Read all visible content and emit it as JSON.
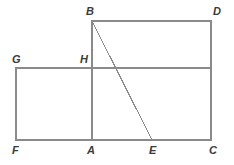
{
  "figure": {
    "width": 234,
    "height": 165,
    "background_color": "#ffffff",
    "stroke_color": "#8a8a8a",
    "label_color": "#3a3a3a",
    "stroke_width": 1.1,
    "points": {
      "A": {
        "x": 92,
        "y": 140
      },
      "B": {
        "x": 92,
        "y": 21
      },
      "C": {
        "x": 211,
        "y": 140
      },
      "D": {
        "x": 211,
        "y": 21
      },
      "E": {
        "x": 152,
        "y": 140
      },
      "F": {
        "x": 16,
        "y": 140
      },
      "G": {
        "x": 16,
        "y": 68
      },
      "H": {
        "x": 92,
        "y": 68
      }
    },
    "labels": [
      {
        "id": "B",
        "text": "B",
        "x": 86,
        "y": 6
      },
      {
        "id": "D",
        "text": "D",
        "x": 213,
        "y": 6
      },
      {
        "id": "G",
        "text": "G",
        "x": 12,
        "y": 54
      },
      {
        "id": "H",
        "text": "H",
        "x": 80,
        "y": 54
      },
      {
        "id": "F",
        "text": "F",
        "x": 12,
        "y": 145
      },
      {
        "id": "A",
        "text": "A",
        "x": 87,
        "y": 145
      },
      {
        "id": "E",
        "text": "E",
        "x": 149,
        "y": 145
      },
      {
        "id": "C",
        "text": "C",
        "x": 209,
        "y": 145
      }
    ],
    "segments": [
      {
        "id": "BD",
        "name": "top-edge-bd",
        "x1": 92,
        "y1": 21,
        "x2": 211,
        "y2": 21
      },
      {
        "id": "DC",
        "name": "right-edge-dc",
        "x1": 211,
        "y1": 21,
        "x2": 211,
        "y2": 140
      },
      {
        "id": "FC",
        "name": "bottom-edge-fc",
        "x1": 16,
        "y1": 140,
        "x2": 211,
        "y2": 140
      },
      {
        "id": "GF",
        "name": "left-edge-gf",
        "x1": 16,
        "y1": 68,
        "x2": 16,
        "y2": 140
      },
      {
        "id": "GD",
        "name": "horizontal-edge-gd",
        "x1": 16,
        "y1": 68,
        "x2": 211,
        "y2": 68
      },
      {
        "id": "BA",
        "name": "vertical-edge-ba",
        "x1": 92,
        "y1": 21,
        "x2": 92,
        "y2": 140
      },
      {
        "id": "BE",
        "name": "diagonal-be",
        "x1": 92,
        "y1": 21,
        "x2": 152,
        "y2": 140
      }
    ]
  }
}
